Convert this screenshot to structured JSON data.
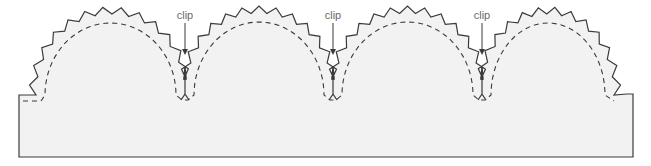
{
  "diagram": {
    "colors": {
      "fill": "#f2f2f2",
      "outline": "#3a3a3a",
      "seam": "#3a3a3a",
      "label": "#6a6a6a"
    },
    "base": {
      "left": 19,
      "right": 633,
      "top_left": 95,
      "top_right": 94,
      "bottom": 157
    },
    "scallops": [
      {
        "start": 36,
        "end": 185,
        "peak": 14
      },
      {
        "start": 185,
        "end": 333,
        "peak": 13
      },
      {
        "start": 333,
        "end": 482,
        "peak": 13
      },
      {
        "start": 482,
        "end": 614,
        "peak": 14
      }
    ],
    "clips": [
      {
        "label": "clip",
        "x": 185
      },
      {
        "label": "clip",
        "x": 333
      },
      {
        "label": "clip",
        "x": 482
      }
    ],
    "valley_y": 66,
    "clip_bottom_y": 100
  }
}
